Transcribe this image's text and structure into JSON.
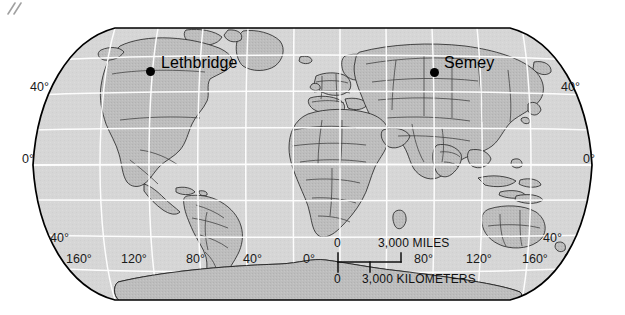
{
  "map": {
    "type": "world-map",
    "projection": "robinson",
    "colors": {
      "ocean": "#d6d6d6",
      "land": "#bdbdbd",
      "land_shade": "#b0b0b0",
      "graticule": "#ffffff",
      "border": "#3a3a3a",
      "coastline": "#111111",
      "outline": "#000000",
      "text": "#111111",
      "page": "#ffffff"
    },
    "cities": [
      {
        "name": "Lethbridge",
        "dot_x": 150,
        "dot_y": 71,
        "label_x": 161,
        "label_y": 62
      },
      {
        "name": "Semey",
        "dot_x": 434,
        "dot_y": 72,
        "label_x": 444,
        "label_y": 62
      }
    ],
    "latitude_labels_left": [
      {
        "text": "40°",
        "x": 30,
        "y": 87
      },
      {
        "text": "0°",
        "x": 24,
        "y": 159
      },
      {
        "text": "40°",
        "x": 50,
        "y": 238
      }
    ],
    "latitude_labels_right": [
      {
        "text": "40°",
        "x": 567,
        "y": 87
      },
      {
        "text": "0°",
        "x": 587,
        "y": 159
      },
      {
        "text": "40°",
        "x": 549,
        "y": 238
      }
    ],
    "longitude_labels": [
      {
        "text": "160°",
        "x": 88
      },
      {
        "text": "120°",
        "x": 143
      },
      {
        "text": "80°",
        "x": 203
      },
      {
        "text": "40°",
        "x": 260
      },
      {
        "text": "0°",
        "x": 317
      },
      {
        "text": "80°",
        "x": 430
      },
      {
        "text": "120°",
        "x": 486
      },
      {
        "text": "160°",
        "x": 542
      }
    ],
    "longitude_label_y": 252,
    "scale_bars": {
      "miles": {
        "zero": "0",
        "label": "3,000 MILES"
      },
      "kilometers": {
        "zero": "0",
        "label": "3,000 KILOMETERS"
      }
    }
  }
}
